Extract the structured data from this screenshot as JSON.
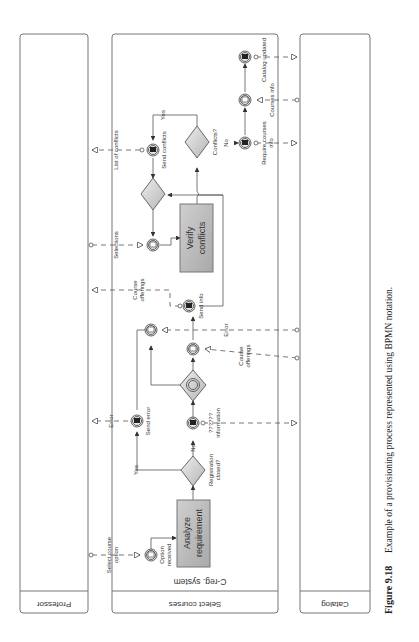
{
  "figure": {
    "number": "Figure 9.18",
    "caption": "Example of a provisioning process represented using BPMN notation."
  },
  "pools": {
    "professor": {
      "label": "Professor"
    },
    "select_courses": {
      "label": "Select courses",
      "lane_label": "C-reg. system"
    },
    "catalog": {
      "label": "Catalog"
    }
  },
  "tasks": {
    "analyze": {
      "line1": "Analyze",
      "line2": "requirement"
    },
    "verify": {
      "line1": "Verify",
      "line2": "conflicts"
    }
  },
  "events": {
    "option_received": {
      "line1": "Option",
      "line2": "received"
    },
    "send_error": "Send error",
    "information": {
      "line1": "??????",
      "line2": "information"
    },
    "send_info": "Send info",
    "send_conflicts": "Send conflicts",
    "require_courses": {
      "line1": "Require courses",
      "line2": "info"
    },
    "courses_info": "Courses info",
    "catalog_updated": "Catalog updated"
  },
  "gateways": {
    "registration_closed": {
      "line1": "Registration",
      "line2": "closed?"
    },
    "conflicts": "Conflicts?"
  },
  "flow_labels": {
    "yes1": "Yes",
    "no1": "No",
    "yes2": "Yes",
    "no2": "No"
  },
  "messages": {
    "select_course_option": {
      "line1": "Select course",
      "line2": "option"
    },
    "error_to_prof": "Error",
    "course_offerings_to_prof": {
      "line1": "Course",
      "line2": "offerings"
    },
    "selections": "Selections",
    "list_of_conflicts": "List of conflicts",
    "error_from_catalog": "Error",
    "course_offerings_from_catalog": {
      "line1": "Course",
      "line2": "offerings"
    }
  },
  "colors": {
    "task_fill": "#b8b8b8",
    "gateway_fill": "#d4d4d4",
    "line": "#555555"
  }
}
